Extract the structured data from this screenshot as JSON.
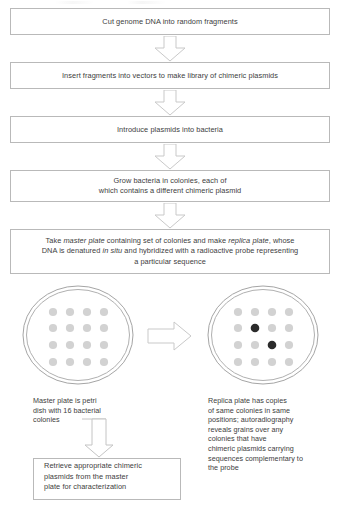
{
  "figure": {
    "type": "flowchart-diagram"
  },
  "steps": [
    {
      "id": "step-1",
      "text": "Cut genome DNA into random fragments"
    },
    {
      "id": "step-2",
      "text": "Insert fragments into vectors to make library of chimeric plasmids"
    },
    {
      "id": "step-3",
      "text": "Introduce plasmids into bacteria"
    },
    {
      "id": "step-4",
      "line1": "Grow bacteria in colonies, each of",
      "line2": "which contains a different chimeric plasmid"
    },
    {
      "id": "step-5",
      "part1": "Take ",
      "em1": "master plate",
      "part2": " containing set of colonies and make ",
      "em2": "replica",
      "part3": " ",
      "em3": "plate",
      "part4": ", whose DNA is denatured ",
      "em4": "in situ",
      "part5": " and hybridized with a radioactive probe representing a particular sequence"
    },
    {
      "id": "step-6",
      "line1": "Retrieve appropriate chimeric",
      "line2": "plasmids from the master",
      "line3": "plate for characterization"
    }
  ],
  "plates": {
    "master": {
      "label": "master-plate",
      "caption_line1": "Master plate is petri",
      "caption_line2": "dish with 16 bacterial",
      "caption_line3": "colonies",
      "rows": 4,
      "cols": 4,
      "colony_count": 16,
      "colony_color": "#d2d2d2",
      "positive_positions": []
    },
    "replica": {
      "label": "replica-plate",
      "caption_line1": "Replica plate has copies",
      "caption_line2": "of same colonies in same",
      "caption_line3": "positions; autoradiography",
      "caption_line4": "reveals grains over any",
      "caption_line5": "colonies that have",
      "caption_line6": "chimeric plasmids carrying",
      "caption_line7": "sequences complementary to",
      "caption_line8": "the probe",
      "rows": 4,
      "cols": 4,
      "colony_count": 16,
      "colony_color": "#d2d2d2",
      "positive_color": "#2b2b2b",
      "positive_positions": [
        {
          "row": 2,
          "col": 2
        },
        {
          "row": 3,
          "col": 3
        }
      ]
    }
  },
  "arrows": {
    "down_1_2": "down-arrow",
    "down_2_3": "down-arrow",
    "down_3_4": "down-arrow",
    "down_4_5": "down-arrow",
    "down_5_plates": "down-arrow",
    "master_to_replica": "right-arrow",
    "caption_to_retrieve": "thin-down-arrow"
  },
  "colors": {
    "box_border": "#b9b9b9",
    "text": "#3d3d3d",
    "arrow_outline": "#c4c4c4",
    "dish_outline": "#9a9a9a",
    "colony_light": "#d2d2d2",
    "colony_dark": "#2b2b2b",
    "background": "#ffffff"
  }
}
